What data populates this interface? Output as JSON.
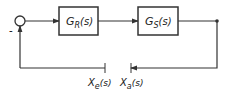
{
  "diagram": {
    "type": "feedback-control-loop",
    "summing_junction": {
      "sign": "-"
    },
    "blocks": [
      {
        "id": "controller",
        "main": "G",
        "sub": "R",
        "arg": "(s)"
      },
      {
        "id": "plant",
        "main": "G",
        "sub": "S",
        "arg": "(s)"
      }
    ],
    "cut_labels": [
      {
        "id": "xe",
        "main": "X",
        "sub": "e",
        "arg": "(s)"
      },
      {
        "id": "xa",
        "main": "X",
        "sub": "a",
        "arg": "(s)"
      }
    ],
    "colors": {
      "line": "#333333",
      "background": "#ffffff"
    }
  }
}
